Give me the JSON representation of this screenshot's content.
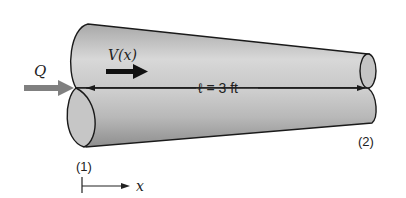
{
  "diagram": {
    "type": "tapered-pipe",
    "flow_label": "Q",
    "velocity_label": "V(x)",
    "length_label": "ℓ = 3 ft",
    "section_inlet_label": "(1)",
    "section_outlet_label": "(2)",
    "axis_label": "x",
    "colors": {
      "pipe_fill_light": "#d6d6d6",
      "pipe_fill_dark": "#9c9c9c",
      "end_face": "#c4c4c4",
      "outline": "#1a1a1a",
      "flow_arrow": "#808080",
      "velocity_arrow": "#111111"
    }
  }
}
